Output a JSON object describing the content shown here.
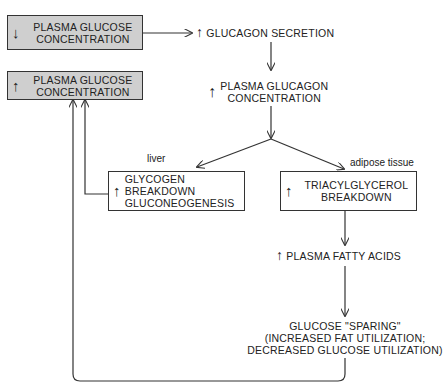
{
  "nodes": {
    "low_glucose": {
      "arrow": "↓",
      "line1": "PLASMA GLUCOSE",
      "line2": "CONCENTRATION"
    },
    "high_glucose": {
      "arrow": "↑",
      "line1": "PLASMA GLUCOSE",
      "line2": "CONCENTRATION"
    },
    "glucagon_secretion": {
      "arrow": "↑",
      "text": "GLUCAGON SECRETION"
    },
    "plasma_glucagon": {
      "arrow": "↑",
      "line1": "PLASMA GLUCAGON",
      "line2": "CONCENTRATION"
    },
    "liver_box": {
      "arrow": "↑",
      "line1": "GLYCOGEN BREAKDOWN",
      "line2": "GLUCONEOGENESIS"
    },
    "adipose_box": {
      "arrow": "↑",
      "line1": "TRIACYLGLYCEROL",
      "line2": "BREAKDOWN"
    },
    "fatty_acids": {
      "arrow": "↑",
      "text": "PLASMA FATTY ACIDS"
    },
    "glucose_sparing": {
      "line1": "GLUCOSE \"SPARING\"",
      "line2": "(INCREASED FAT UTILIZATION;",
      "line3": "DECREASED GLUCOSE UTILIZATION)"
    }
  },
  "labels": {
    "liver": "liver",
    "adipose": "adipose tissue"
  },
  "colors": {
    "grey_box": "#cfcfcf",
    "line": "#333333"
  }
}
